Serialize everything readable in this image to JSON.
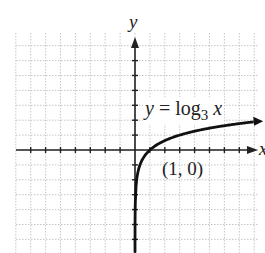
{
  "chart_data": {
    "type": "line",
    "title": "",
    "function": "y = log_3 x",
    "xlabel": "x",
    "ylabel": "y",
    "grid": true,
    "xlim": [
      -8,
      9
    ],
    "ylim": [
      -7,
      8
    ],
    "series": [
      {
        "name": "y = log3 x",
        "points": [
          [
            0.01,
            -4.19
          ],
          [
            0.05,
            -2.73
          ],
          [
            0.1,
            -2.1
          ],
          [
            0.25,
            -1.26
          ],
          [
            0.5,
            -0.63
          ],
          [
            1,
            0
          ],
          [
            2,
            0.63
          ],
          [
            3,
            1
          ],
          [
            5,
            1.46
          ],
          [
            9,
            2
          ]
        ]
      }
    ],
    "annotations": [
      {
        "text": "(1, 0)",
        "x": 1,
        "y": 0
      },
      {
        "text": "y = log 3 x",
        "position": "upper-right"
      }
    ]
  },
  "labels": {
    "y_axis": "y",
    "x_axis": "x",
    "equation_y": "y",
    "equation_eq": "=",
    "equation_log": "log",
    "equation_base": "3",
    "equation_x": "x",
    "point": "(1, 0)"
  }
}
